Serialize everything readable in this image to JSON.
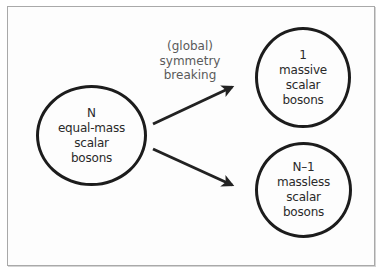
{
  "diagram": {
    "colors": {
      "frame_border": "#a9a9a9",
      "circle_stroke": "#1c1c1c",
      "node_text": "#2a2a2a",
      "label_text": "#5a5a5a",
      "arrow": "#222222",
      "background": "#ffffff"
    },
    "nodes": [
      {
        "id": "source",
        "lines": [
          "N",
          "equal-mass",
          "scalar",
          "bosons"
        ]
      },
      {
        "id": "massive",
        "lines": [
          "1",
          "massive",
          "scalar",
          "bosons"
        ]
      },
      {
        "id": "massless",
        "lines": [
          "N–1",
          "massless",
          "scalar",
          "bosons"
        ]
      }
    ],
    "edge_label": {
      "lines": [
        "(global)",
        "symmetry",
        "breaking"
      ]
    },
    "edges": [
      {
        "from": "source",
        "to": "massive",
        "label": "(global) symmetry breaking"
      },
      {
        "from": "source",
        "to": "massless"
      }
    ]
  }
}
